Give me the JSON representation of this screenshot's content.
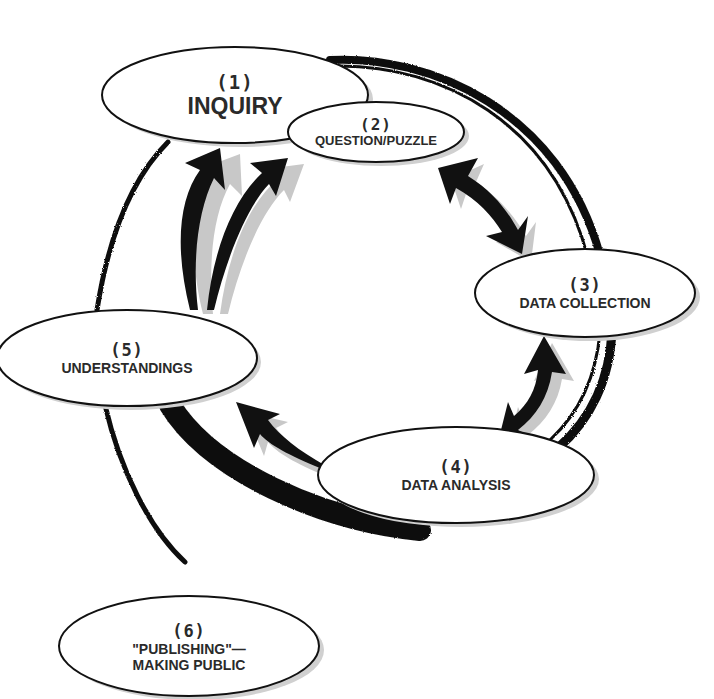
{
  "diagram": {
    "type": "cycle",
    "colors": {
      "ink": "#111111",
      "shadow": "#c8c8c8",
      "text": "#2a2a2a",
      "background": "#ffffff"
    },
    "nodes": [
      {
        "id": "n1",
        "number": "(1)",
        "label": "INQUIRY"
      },
      {
        "id": "n2",
        "number": "(2)",
        "label": "QUESTION/PUZZLE"
      },
      {
        "id": "n3",
        "number": "(3)",
        "label": "DATA COLLECTION"
      },
      {
        "id": "n4",
        "number": "(4)",
        "label": "DATA ANALYSIS"
      },
      {
        "id": "n5",
        "number": "(5)",
        "label": "UNDERSTANDINGS"
      },
      {
        "id": "n6",
        "number": "(6)",
        "label_line1": "\"PUBLISHING\"—",
        "label_line2": "MAKING PUBLIC"
      }
    ],
    "edges": [
      {
        "from": "QUESTION/PUZZLE",
        "to": "DATA COLLECTION",
        "style": "double-arrow"
      },
      {
        "from": "DATA COLLECTION",
        "to": "DATA ANALYSIS",
        "style": "double-arrow"
      },
      {
        "from": "DATA ANALYSIS",
        "to": "UNDERSTANDINGS",
        "style": "arrow"
      },
      {
        "from": "UNDERSTANDINGS",
        "to": "INQUIRY",
        "style": "arrow"
      },
      {
        "from": "UNDERSTANDINGS",
        "to": "QUESTION/PUZZLE",
        "style": "arrow"
      },
      {
        "from": "UNDERSTANDINGS",
        "to": "\"PUBLISHING\"—MAKING PUBLIC",
        "style": "brush-line"
      }
    ]
  }
}
